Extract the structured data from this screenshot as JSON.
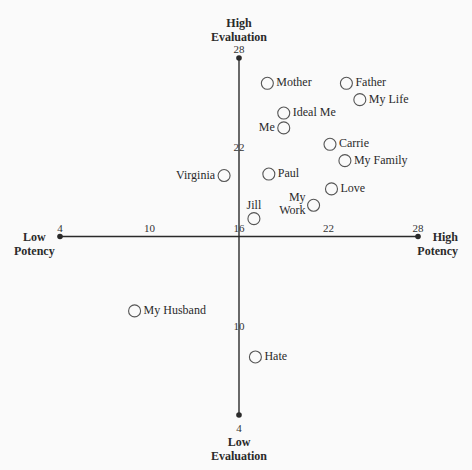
{
  "chart_data": {
    "type": "scatter",
    "title": "",
    "xlabel": "Potency",
    "ylabel": "Evaluation",
    "x_axis": {
      "min": 4,
      "max": 28,
      "cross_at": 16,
      "low_label": [
        "Low",
        "Potency"
      ],
      "high_label": [
        "High",
        "Potency"
      ],
      "ticks": [
        4,
        10,
        16,
        22,
        28
      ]
    },
    "y_axis": {
      "min": 4,
      "max": 28,
      "cross_at": 16,
      "low_label": [
        "Low",
        "Evaluation"
      ],
      "high_label": [
        "High",
        "Evaluation"
      ],
      "ticks": [
        4,
        10,
        16,
        22,
        28
      ]
    },
    "grid": false,
    "legend": "none",
    "points": [
      {
        "label": "Mother",
        "x": 17.9,
        "y": 26.3,
        "label_pos": "right"
      },
      {
        "label": "Father",
        "x": 23.2,
        "y": 26.3,
        "label_pos": "right"
      },
      {
        "label": "My Life",
        "x": 24.1,
        "y": 25.2,
        "label_pos": "right"
      },
      {
        "label": "Ideal Me",
        "x": 19.0,
        "y": 24.3,
        "label_pos": "right"
      },
      {
        "label": "Me",
        "x": 19.0,
        "y": 23.3,
        "label_pos": "left"
      },
      {
        "label": "Carrie",
        "x": 22.1,
        "y": 22.2,
        "label_pos": "right"
      },
      {
        "label": "My Family",
        "x": 23.1,
        "y": 21.1,
        "label_pos": "right"
      },
      {
        "label": "Virginia",
        "x": 15.0,
        "y": 20.1,
        "label_pos": "left"
      },
      {
        "label": "Paul",
        "x": 18.0,
        "y": 20.2,
        "label_pos": "right"
      },
      {
        "label": "Love",
        "x": 22.2,
        "y": 19.2,
        "label_pos": "right"
      },
      {
        "label": "My Work",
        "x": 21.0,
        "y": 18.1,
        "label_pos": "left-stacked"
      },
      {
        "label": "Jill",
        "x": 17.0,
        "y": 17.2,
        "label_pos": "above"
      },
      {
        "label": "My Husband",
        "x": 9.0,
        "y": 11.0,
        "label_pos": "right"
      },
      {
        "label": "Hate",
        "x": 17.1,
        "y": 7.9,
        "label_pos": "right"
      }
    ]
  },
  "colors": {
    "axis": "#2a2a2a",
    "marker": "#555555",
    "background": "#fafafa"
  }
}
